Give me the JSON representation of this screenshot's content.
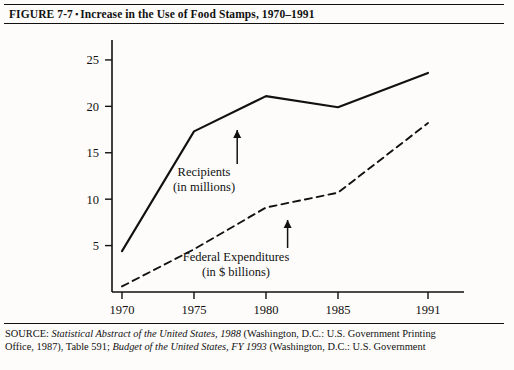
{
  "figure": {
    "label": "FIGURE 7-7",
    "bullet": "▪",
    "title": "Increase in the Use of Food Stamps, 1970–1991",
    "full_title": "FIGURE 7-7 ▪ Increase in the Use of Food Stamps, 1970–1991"
  },
  "source": {
    "line1_prefix": "SOURCE: ",
    "line1_italic": "Statistical Abstract of the United States, 1988",
    "line1_suffix": " (Washington, D.C.: U.S. Government Printing",
    "line2_prefix": "Office, 1987), Table 591; ",
    "line2_italic": "Budget of the United States, FY 1993",
    "line2_suffix": " (Washington, D.C.: U.S. Government"
  },
  "chart_data": {
    "type": "line",
    "title": "Increase in the Use of Food Stamps, 1970–1991",
    "xlabel": "",
    "ylabel": "",
    "x": [
      1970,
      1975,
      1980,
      1985,
      1991
    ],
    "xtick_labels": [
      "1970",
      "1975",
      "1980",
      "1985",
      "1991"
    ],
    "ytick_labels": [
      "5",
      "10",
      "15",
      "20",
      "25"
    ],
    "yticks": [
      5,
      10,
      15,
      20,
      25
    ],
    "ylim": [
      0,
      26.5
    ],
    "grid": false,
    "legend_position": "inline-annotations",
    "series": [
      {
        "name": "Recipients (in millions)",
        "style": "solid",
        "color": "#111111",
        "values": [
          4.4,
          17.3,
          21.1,
          19.9,
          23.6
        ],
        "annotation": {
          "line1": "Recipients",
          "line2": "(in millions)",
          "arrow_at_x": 1978
        }
      },
      {
        "name": "Federal Expenditures (in $ billions)",
        "style": "dashed",
        "color": "#111111",
        "values": [
          0.6,
          4.6,
          9.1,
          10.7,
          18.2
        ],
        "annotation": {
          "line1": "Federal Expenditures",
          "line2": "(in $ billions)",
          "arrow_at_x": 1981.5
        }
      }
    ]
  }
}
